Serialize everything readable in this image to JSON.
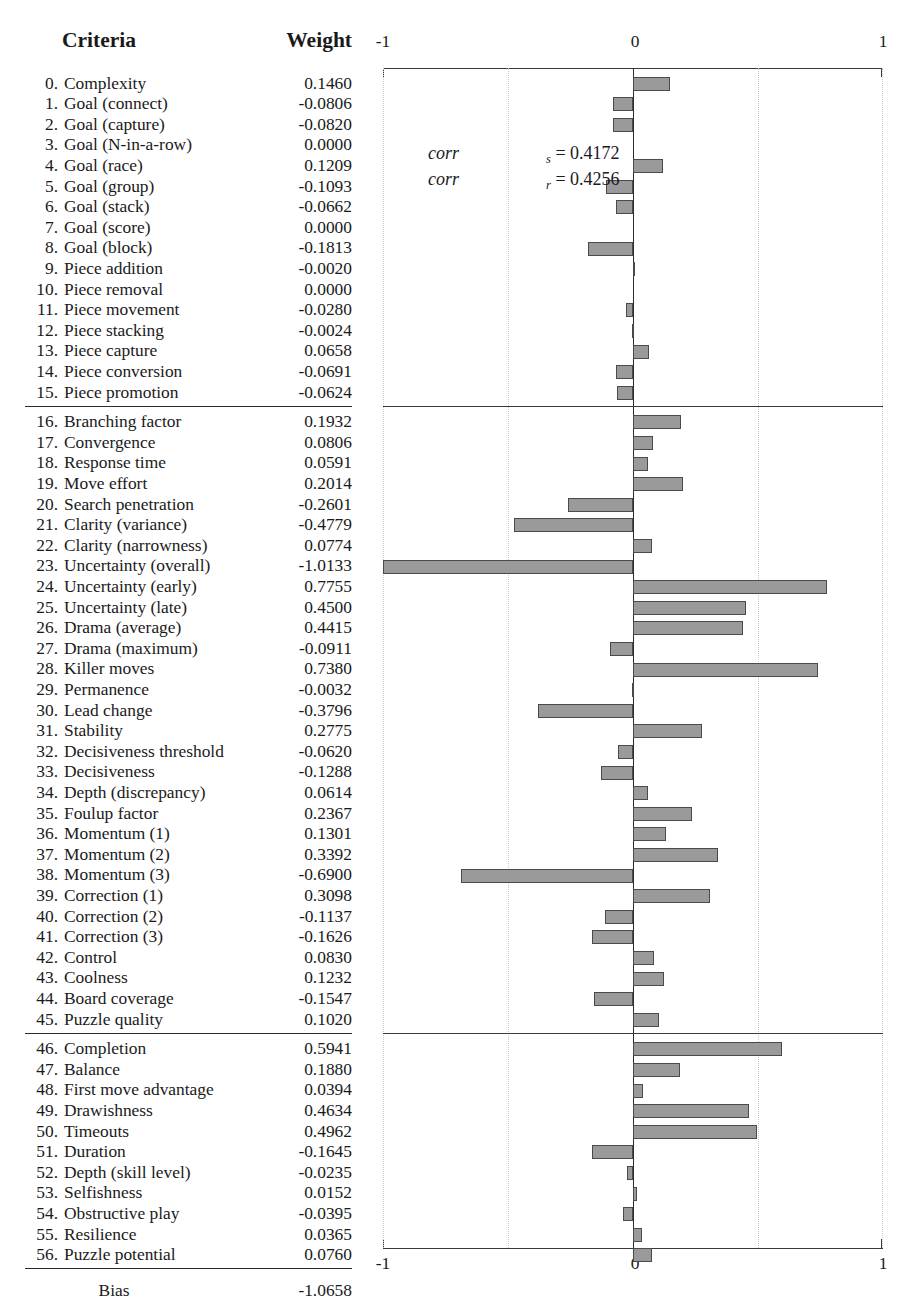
{
  "table": {
    "header_criteria": "Criteria",
    "header_weight": "Weight",
    "bias_label": "Bias",
    "bias_value": "-1.0658",
    "rows": [
      {
        "idx": "0.",
        "label": "Complexity",
        "weight": "0.1460",
        "value": 0.146
      },
      {
        "idx": "1.",
        "label": "Goal (connect)",
        "weight": "-0.0806",
        "value": -0.0806
      },
      {
        "idx": "2.",
        "label": "Goal (capture)",
        "weight": "-0.0820",
        "value": -0.082
      },
      {
        "idx": "3.",
        "label": "Goal (N-in-a-row)",
        "weight": "0.0000",
        "value": 0.0
      },
      {
        "idx": "4.",
        "label": "Goal (race)",
        "weight": "0.1209",
        "value": 0.1209
      },
      {
        "idx": "5.",
        "label": "Goal (group)",
        "weight": "-0.1093",
        "value": -0.1093
      },
      {
        "idx": "6.",
        "label": "Goal (stack)",
        "weight": "-0.0662",
        "value": -0.0662
      },
      {
        "idx": "7.",
        "label": "Goal (score)",
        "weight": "0.0000",
        "value": 0.0
      },
      {
        "idx": "8.",
        "label": "Goal (block)",
        "weight": "-0.1813",
        "value": -0.1813
      },
      {
        "idx": "9.",
        "label": "Piece addition",
        "weight": "-0.0020",
        "value": -0.002
      },
      {
        "idx": "10.",
        "label": "Piece removal",
        "weight": "0.0000",
        "value": 0.0
      },
      {
        "idx": "11.",
        "label": "Piece movement",
        "weight": "-0.0280",
        "value": -0.028
      },
      {
        "idx": "12.",
        "label": "Piece stacking",
        "weight": "-0.0024",
        "value": -0.0024
      },
      {
        "idx": "13.",
        "label": "Piece capture",
        "weight": "0.0658",
        "value": 0.0658
      },
      {
        "idx": "14.",
        "label": "Piece conversion",
        "weight": "-0.0691",
        "value": -0.0691
      },
      {
        "idx": "15.",
        "label": "Piece promotion",
        "weight": "-0.0624",
        "value": -0.0624
      },
      {
        "idx": "16.",
        "label": "Branching factor",
        "weight": "0.1932",
        "value": 0.1932
      },
      {
        "idx": "17.",
        "label": "Convergence",
        "weight": "0.0806",
        "value": 0.0806
      },
      {
        "idx": "18.",
        "label": "Response time",
        "weight": "0.0591",
        "value": 0.0591
      },
      {
        "idx": "19.",
        "label": "Move effort",
        "weight": "0.2014",
        "value": 0.2014
      },
      {
        "idx": "20.",
        "label": "Search penetration",
        "weight": "-0.2601",
        "value": -0.2601
      },
      {
        "idx": "21.",
        "label": "Clarity (variance)",
        "weight": "-0.4779",
        "value": -0.4779
      },
      {
        "idx": "22.",
        "label": "Clarity (narrowness)",
        "weight": "0.0774",
        "value": 0.0774
      },
      {
        "idx": "23.",
        "label": "Uncertainty (overall)",
        "weight": "-1.0133",
        "value": -1.0133
      },
      {
        "idx": "24.",
        "label": "Uncertainty (early)",
        "weight": "0.7755",
        "value": 0.7755
      },
      {
        "idx": "25.",
        "label": "Uncertainty (late)",
        "weight": "0.4500",
        "value": 0.45
      },
      {
        "idx": "26.",
        "label": "Drama (average)",
        "weight": "0.4415",
        "value": 0.4415
      },
      {
        "idx": "27.",
        "label": "Drama (maximum)",
        "weight": "-0.0911",
        "value": -0.0911
      },
      {
        "idx": "28.",
        "label": "Killer moves",
        "weight": "0.7380",
        "value": 0.738
      },
      {
        "idx": "29.",
        "label": "Permanence",
        "weight": "-0.0032",
        "value": -0.0032
      },
      {
        "idx": "30.",
        "label": "Lead change",
        "weight": "-0.3796",
        "value": -0.3796
      },
      {
        "idx": "31.",
        "label": "Stability",
        "weight": "0.2775",
        "value": 0.2775
      },
      {
        "idx": "32.",
        "label": "Decisiveness threshold",
        "weight": "-0.0620",
        "value": -0.062
      },
      {
        "idx": "33.",
        "label": "Decisiveness",
        "weight": "-0.1288",
        "value": -0.1288
      },
      {
        "idx": "34.",
        "label": "Depth (discrepancy)",
        "weight": "0.0614",
        "value": 0.0614
      },
      {
        "idx": "35.",
        "label": "Foulup factor",
        "weight": "0.2367",
        "value": 0.2367
      },
      {
        "idx": "36.",
        "label": "Momentum (1)",
        "weight": "0.1301",
        "value": 0.1301
      },
      {
        "idx": "37.",
        "label": "Momentum (2)",
        "weight": "0.3392",
        "value": 0.3392
      },
      {
        "idx": "38.",
        "label": "Momentum (3)",
        "weight": "-0.6900",
        "value": -0.69
      },
      {
        "idx": "39.",
        "label": "Correction (1)",
        "weight": "0.3098",
        "value": 0.3098
      },
      {
        "idx": "40.",
        "label": "Correction (2)",
        "weight": "-0.1137",
        "value": -0.1137
      },
      {
        "idx": "41.",
        "label": "Correction (3)",
        "weight": "-0.1626",
        "value": -0.1626
      },
      {
        "idx": "42.",
        "label": "Control",
        "weight": "0.0830",
        "value": 0.083
      },
      {
        "idx": "43.",
        "label": "Coolness",
        "weight": "0.1232",
        "value": 0.1232
      },
      {
        "idx": "44.",
        "label": "Board coverage",
        "weight": "-0.1547",
        "value": -0.1547
      },
      {
        "idx": "45.",
        "label": "Puzzle quality",
        "weight": "0.1020",
        "value": 0.102
      },
      {
        "idx": "46.",
        "label": "Completion",
        "weight": "0.5941",
        "value": 0.5941
      },
      {
        "idx": "47.",
        "label": "Balance",
        "weight": "0.1880",
        "value": 0.188
      },
      {
        "idx": "48.",
        "label": "First move advantage",
        "weight": "0.0394",
        "value": 0.0394
      },
      {
        "idx": "49.",
        "label": "Drawishness",
        "weight": "0.4634",
        "value": 0.4634
      },
      {
        "idx": "50.",
        "label": "Timeouts",
        "weight": "0.4962",
        "value": 0.4962
      },
      {
        "idx": "51.",
        "label": "Duration",
        "weight": "-0.1645",
        "value": -0.1645
      },
      {
        "idx": "52.",
        "label": "Depth (skill level)",
        "weight": "-0.0235",
        "value": -0.0235
      },
      {
        "idx": "53.",
        "label": "Selfishness",
        "weight": "0.0152",
        "value": 0.0152
      },
      {
        "idx": "54.",
        "label": "Obstructive play",
        "weight": "-0.0395",
        "value": -0.0395
      },
      {
        "idx": "55.",
        "label": "Resilience",
        "weight": "0.0365",
        "value": 0.0365
      },
      {
        "idx": "56.",
        "label": "Puzzle potential",
        "weight": "0.0760",
        "value": 0.076
      }
    ],
    "separator_after_rows": [
      15,
      45,
      56
    ]
  },
  "chart": {
    "axis_min_label": "-1",
    "axis_zero_label": "0",
    "axis_max_label": "1",
    "corr_s": {
      "name": "corr",
      "sub": "s",
      "text": "= 0.4172",
      "value": 0.4172
    },
    "corr_r": {
      "name": "corr",
      "sub": "r",
      "text": "= 0.4256",
      "value": 0.4256
    },
    "bar_fill": "#9a9a9a",
    "bar_stroke": "#4a4a4a"
  },
  "chart_data": {
    "type": "bar",
    "orientation": "horizontal",
    "title": "",
    "xlabel": "Weight",
    "ylabel": "Criteria",
    "xlim": [
      -1,
      1
    ],
    "xticks": [
      -1,
      0,
      1
    ],
    "grid": true,
    "legend": null,
    "annotations": [
      "corr_s = 0.4172",
      "corr_r = 0.4256"
    ],
    "categories": [
      "0. Complexity",
      "1. Goal (connect)",
      "2. Goal (capture)",
      "3. Goal (N-in-a-row)",
      "4. Goal (race)",
      "5. Goal (group)",
      "6. Goal (stack)",
      "7. Goal (score)",
      "8. Goal (block)",
      "9. Piece addition",
      "10. Piece removal",
      "11. Piece movement",
      "12. Piece stacking",
      "13. Piece capture",
      "14. Piece conversion",
      "15. Piece promotion",
      "16. Branching factor",
      "17. Convergence",
      "18. Response time",
      "19. Move effort",
      "20. Search penetration",
      "21. Clarity (variance)",
      "22. Clarity (narrowness)",
      "23. Uncertainty (overall)",
      "24. Uncertainty (early)",
      "25. Uncertainty (late)",
      "26. Drama (average)",
      "27. Drama (maximum)",
      "28. Killer moves",
      "29. Permanence",
      "30. Lead change",
      "31. Stability",
      "32. Decisiveness threshold",
      "33. Decisiveness",
      "34. Depth (discrepancy)",
      "35. Foulup factor",
      "36. Momentum (1)",
      "37. Momentum (2)",
      "38. Momentum (3)",
      "39. Correction (1)",
      "40. Correction (2)",
      "41. Correction (3)",
      "42. Control",
      "43. Coolness",
      "44. Board coverage",
      "45. Puzzle quality",
      "46. Completion",
      "47. Balance",
      "48. First move advantage",
      "49. Drawishness",
      "50. Timeouts",
      "51. Duration",
      "52. Depth (skill level)",
      "53. Selfishness",
      "54. Obstructive play",
      "55. Resilience",
      "56. Puzzle potential"
    ],
    "values": [
      0.146,
      -0.0806,
      -0.082,
      0.0,
      0.1209,
      -0.1093,
      -0.0662,
      0.0,
      -0.1813,
      -0.002,
      0.0,
      -0.028,
      -0.0024,
      0.0658,
      -0.0691,
      -0.0624,
      0.1932,
      0.0806,
      0.0591,
      0.2014,
      -0.2601,
      -0.4779,
      0.0774,
      -1.0133,
      0.7755,
      0.45,
      0.4415,
      -0.0911,
      0.738,
      -0.0032,
      -0.3796,
      0.2775,
      -0.062,
      -0.1288,
      0.0614,
      0.2367,
      0.1301,
      0.3392,
      -0.69,
      0.3098,
      -0.1137,
      -0.1626,
      0.083,
      0.1232,
      -0.1547,
      0.102,
      0.5941,
      0.188,
      0.0394,
      0.4634,
      0.4962,
      -0.1645,
      -0.0235,
      0.0152,
      -0.0395,
      0.0365,
      0.076
    ],
    "bias": -1.0658
  }
}
